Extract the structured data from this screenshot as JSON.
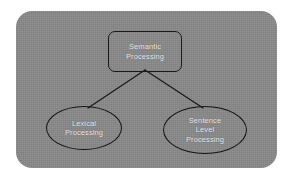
{
  "diagram": {
    "panel": {
      "background_color": "#8a8a8a",
      "corner_radius": "16px"
    },
    "colors": {
      "panel_background": "#8a8a8a",
      "page_background": "#ffffff",
      "node_border": "#1a1a1a",
      "node_text": "#eceaea",
      "edge_line": "#1a1a1a"
    },
    "nodes": [
      {
        "id": "semantic",
        "shape": "rounded-rectangle",
        "label": "Semantic\nProcessing",
        "line1": "Semantic",
        "line2": "Processing"
      },
      {
        "id": "lexical",
        "shape": "ellipse",
        "label": "Lexical\nProcessing",
        "line1": "Lexical",
        "line2": "Processing"
      },
      {
        "id": "sentence",
        "shape": "ellipse",
        "label": "Sentence\nLevel\nProcessing",
        "line1": "Sentence",
        "line2": "Level",
        "line3": "Processing"
      }
    ],
    "edges": [
      {
        "id": "semantic-to-lexical",
        "from": "semantic",
        "to": "lexical"
      },
      {
        "id": "semantic-to-sentence",
        "from": "semantic",
        "to": "sentence"
      }
    ]
  }
}
